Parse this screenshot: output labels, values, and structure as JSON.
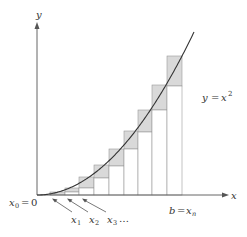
{
  "diagram": {
    "axes": {
      "x_label": "x",
      "y_label": "y"
    },
    "curve_label": {
      "lhs": "y",
      "eq": "=",
      "rhs": "x",
      "exp": "2"
    },
    "origin_label": {
      "var": "x",
      "sub": "0",
      "eq": "=",
      "val": "0"
    },
    "end_label": {
      "lhs": "b",
      "eq": "=",
      "var": "x",
      "sub": "n"
    },
    "partition_labels": [
      {
        "var": "x",
        "sub": "1"
      },
      {
        "var": "x",
        "sub": "2"
      },
      {
        "var": "x",
        "sub": "3"
      }
    ],
    "ellipsis": "…",
    "colors": {
      "axis": "#555555",
      "curve": "#333333",
      "overestimate_fill": "#d9d9d9",
      "rect_stroke": "#999999",
      "background": "#ffffff"
    },
    "partition_x_px": [
      50,
      65,
      79,
      94,
      109,
      124,
      138,
      152,
      167,
      182
    ],
    "upper_tops_px": [
      192,
      188,
      177,
      165,
      149,
      131,
      110,
      85,
      56
    ],
    "lower_tops_px": [
      195,
      192,
      188,
      178,
      166,
      149,
      132,
      110,
      86
    ]
  }
}
